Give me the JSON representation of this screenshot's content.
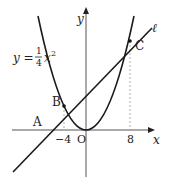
{
  "diagram": {
    "curve_label": {
      "lhs": "y =",
      "num": "1",
      "den": "4",
      "var": "x",
      "exp": "2"
    },
    "line_label": "ℓ",
    "axis_x_label": "x",
    "axis_y_label": "y",
    "origin_label": "O",
    "points": [
      {
        "name": "A",
        "x": -8,
        "y": 0
      },
      {
        "name": "B",
        "x": -4,
        "y": 4
      },
      {
        "name": "C",
        "x": 8,
        "y": 16
      }
    ],
    "ticks": {
      "neg4": "−4",
      "pos8": "8"
    },
    "colors": {
      "stroke": "#1a1a1a",
      "dashed": "#999999",
      "axis": "#555555"
    }
  }
}
